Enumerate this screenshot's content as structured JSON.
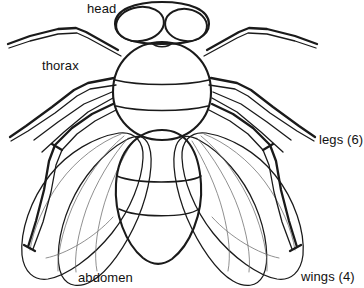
{
  "figure": {
    "view": "dorsal",
    "style": "black-and-white line drawing",
    "background_color": "#ffffff",
    "ink_color": "#1a1a1a",
    "vein_color": "#6b6b6b"
  },
  "labels": {
    "head": "head",
    "thorax": "thorax",
    "abdomen": "abdomen",
    "legs": "legs (6)",
    "wings": "wings (4)"
  },
  "parts": {
    "eyes": {
      "name": "compound eyes",
      "count": 2,
      "fill_pattern": "cross-hatch"
    },
    "thorax": {
      "name": "thorax",
      "segment_lines": 2
    },
    "abdomen": {
      "name": "abdomen",
      "segment_lines": 2
    },
    "legs": {
      "name": "legs",
      "count": 6
    },
    "wings": {
      "name": "wings",
      "count": 4
    }
  }
}
